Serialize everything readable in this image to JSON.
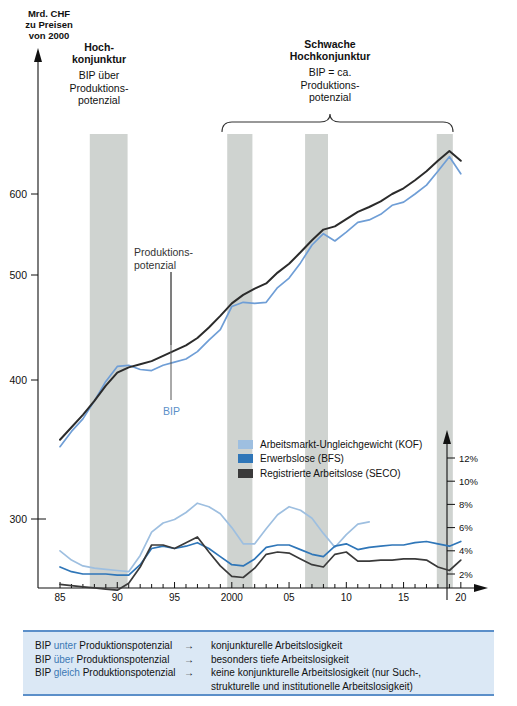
{
  "axis": {
    "y_left_title": [
      "Mrd. CHF",
      "zu Preisen",
      "von 2000"
    ],
    "y_left_ticks": [
      300,
      400,
      500,
      600
    ],
    "y_right_ticks": [
      "2%",
      "4%",
      "6%",
      "8%",
      "10%",
      "12%"
    ],
    "x_ticks": [
      "85",
      "90",
      "95",
      "2000",
      "05",
      "10",
      "15",
      "20"
    ]
  },
  "phases": {
    "left": {
      "head": [
        "Hoch-",
        "konjunktur"
      ],
      "sub": [
        "BIP über",
        "Produktions-",
        "potenzial"
      ]
    },
    "right": {
      "head": [
        "Schwache",
        "Hochkonjunktur"
      ],
      "sub": [
        "BIP = ca.",
        "Produktions-",
        "potenzial"
      ]
    }
  },
  "annotations": {
    "potential": [
      "Produktions-",
      "potenzial"
    ],
    "gdp": "BIP"
  },
  "legend": [
    {
      "label": "Arbeitsmarkt-Ungleichgewicht (KOF)",
      "color": "#9ebfe0"
    },
    {
      "label": "Erwerbslose (BFS)",
      "color": "#2f76b8"
    },
    {
      "label": "Registrierte Arbeitslose (SECO)",
      "color": "#3a3a3a"
    }
  ],
  "footnote": {
    "rows": [
      {
        "pre": "BIP",
        "kw": "unter",
        "post": "Produktionspotenzial",
        "arrow": "→",
        "result": "konjunkturelle Arbeitslosigkeit",
        "result2": ""
      },
      {
        "pre": "BIP",
        "kw": "über",
        "post": "Produktionspotenzial",
        "arrow": "→",
        "result": "besonders tiefe Arbeitslosigkeit",
        "result2": ""
      },
      {
        "pre": "BIP",
        "kw": "gleich",
        "post": "Produktionspotenzial",
        "arrow": "→",
        "result": "keine konjunkturelle Arbeitslosigkeit (nur Such-,",
        "result2": "strukturelle und institutionelle Arbeitslosigkeit)"
      }
    ]
  },
  "chart_data": {
    "type": "line",
    "title": "",
    "xlabel": "",
    "ylabel": "Mrd. CHF zu Preisen von 2000",
    "x": [
      1985,
      1986,
      1987,
      1988,
      1989,
      1990,
      1991,
      1992,
      1993,
      1994,
      1995,
      1996,
      1997,
      1998,
      1999,
      2000,
      2001,
      2002,
      2003,
      2004,
      2005,
      2006,
      2007,
      2008,
      2009,
      2010,
      2011,
      2012,
      2013,
      2014,
      2015,
      2016,
      2017,
      2018,
      2019,
      2020
    ],
    "xlim": [
      1984.3,
      2020.8
    ],
    "ylim_left": [
      270,
      680
    ],
    "ylim_right": [
      0,
      13
    ],
    "grid": false,
    "legend_position": "middle-right",
    "shaded_bands": [
      {
        "from": 1987.6,
        "to": 1990.9
      },
      {
        "from": 1999.6,
        "to": 2001.8
      },
      {
        "from": 2006.4,
        "to": 2008.4
      },
      {
        "from": 2017.9,
        "to": 2019.3
      }
    ],
    "series": [
      {
        "name": "Produktionspotenzial",
        "color": "#2b2b2b",
        "axis": "left",
        "unit": "Mrd. CHF",
        "values": [
          357,
          366,
          375,
          385,
          396,
          407,
          412,
          415,
          418,
          423,
          428,
          433,
          440,
          450,
          461,
          473,
          481,
          487,
          492,
          503,
          514,
          528,
          543,
          556,
          560,
          569,
          578,
          584,
          591,
          600,
          607,
          617,
          628,
          641,
          653,
          641
        ]
      },
      {
        "name": "BIP",
        "color": "#6f9ed6",
        "axis": "left",
        "unit": "Mrd. CHF",
        "values": [
          352,
          363,
          372,
          385,
          399,
          413,
          414,
          410,
          409,
          414,
          417,
          420,
          427,
          438,
          448,
          470,
          474,
          473,
          474,
          488,
          497,
          515,
          537,
          551,
          542,
          553,
          565,
          568,
          575,
          586,
          590,
          600,
          611,
          628,
          646,
          625
        ]
      },
      {
        "name": "Arbeitsmarkt-Ungleichgewicht (KOF)",
        "color": "#9ebfe0",
        "axis": "right",
        "unit": "%",
        "values": [
          4.0,
          3.2,
          2.7,
          2.5,
          2.4,
          2.3,
          2.2,
          3.6,
          5.6,
          6.4,
          6.7,
          7.3,
          8.1,
          7.8,
          7.2,
          6.0,
          4.6,
          4.6,
          5.9,
          7.1,
          7.8,
          7.5,
          6.8,
          5.5,
          4.3,
          5.4,
          6.3,
          6.5,
          null,
          null,
          null,
          null,
          null,
          null,
          null,
          null
        ]
      },
      {
        "name": "Erwerbslose (BFS)",
        "color": "#2f76b8",
        "axis": "right",
        "unit": "%",
        "values": [
          2.6,
          2.2,
          2.0,
          2.0,
          2.0,
          1.9,
          1.9,
          2.8,
          4.2,
          4.4,
          4.2,
          4.4,
          4.7,
          4.2,
          3.5,
          2.8,
          2.7,
          3.3,
          4.3,
          4.5,
          4.5,
          4.1,
          3.7,
          3.5,
          4.4,
          4.6,
          4.1,
          4.3,
          4.4,
          4.5,
          4.5,
          4.7,
          4.8,
          4.6,
          4.4,
          4.8
        ]
      },
      {
        "name": "Registrierte Arbeitslose (SECO)",
        "color": "#3a3a3a",
        "axis": "right",
        "unit": "%",
        "values": [
          1.1,
          1.0,
          0.9,
          0.8,
          0.7,
          0.6,
          1.2,
          2.6,
          4.5,
          4.5,
          4.2,
          4.7,
          5.2,
          3.9,
          2.7,
          1.8,
          1.7,
          2.5,
          3.7,
          3.9,
          3.8,
          3.3,
          2.8,
          2.6,
          3.7,
          3.9,
          3.1,
          3.1,
          3.2,
          3.2,
          3.3,
          3.3,
          3.2,
          2.6,
          2.3,
          3.2
        ]
      }
    ]
  }
}
